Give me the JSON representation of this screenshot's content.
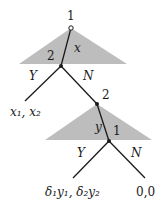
{
  "diagram": {
    "type": "extensive-form game tree",
    "colors": {
      "info_triangle": "#bdbdbd",
      "edge": "#1a1a1a",
      "background": "#ffffff"
    },
    "root": {
      "player_label": "1",
      "offer_label": "x"
    },
    "first_responder": {
      "player_label": "2",
      "accept": "Y",
      "reject": "N",
      "accept_payoff": "x₁, x₂"
    },
    "second_proposer": {
      "player_label": "2",
      "offer_label": "y"
    },
    "second_responder": {
      "player_label": "1",
      "accept": "Y",
      "reject": "N"
    },
    "payoffs": {
      "accept": "δ₁y₁, δ₂y₂",
      "reject": "0,0"
    }
  }
}
